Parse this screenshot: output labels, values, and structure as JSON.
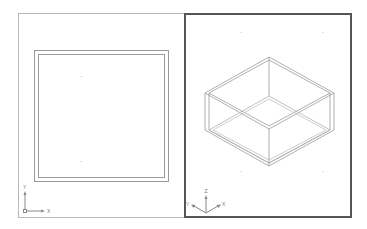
{
  "app": {
    "type": "CAD viewports",
    "layout": "two-viewport vertical split"
  },
  "colors": {
    "background": "#ffffff",
    "inactive_border": "#b8b8b8",
    "active_border": "#555555",
    "geometry_stroke": "#999999",
    "ucs_color": "#888888"
  },
  "viewports": [
    {
      "id": "left",
      "view": "Top (plan)",
      "active": false,
      "shape": "square with offset (double outline)",
      "ucs": {
        "x_label": "X",
        "y_label": "Y"
      }
    },
    {
      "id": "right",
      "view": "SE Isometric",
      "active": true,
      "shape": "isometric open box (double-line walls)",
      "ucs": {
        "x_label": "X",
        "y_label": "Y",
        "z_label": "Z"
      }
    }
  ]
}
